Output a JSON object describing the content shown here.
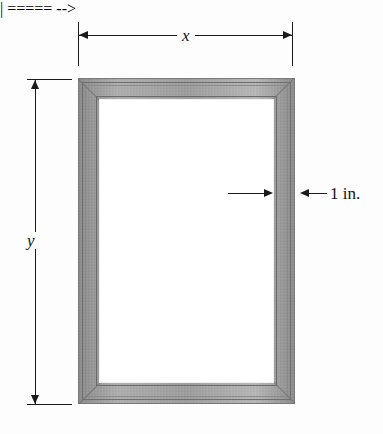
{
  "figure": {
    "type": "geometry-diagram",
    "background_color": "#fdfdfd",
    "line_color": "#1a1a1a",
    "frame_color": "#a2a2a2"
  },
  "dimensions": {
    "width_label": "x",
    "height_label": "y",
    "border_label": "1 in."
  },
  "annotations": {
    "top": {
      "name": "width-dimension",
      "label": "x",
      "orientation": "horizontal"
    },
    "left": {
      "name": "height-dimension",
      "label": "y",
      "orientation": "vertical"
    },
    "right": {
      "name": "border-width-callout",
      "label": "1 in.",
      "orientation": "horizontal"
    }
  }
}
